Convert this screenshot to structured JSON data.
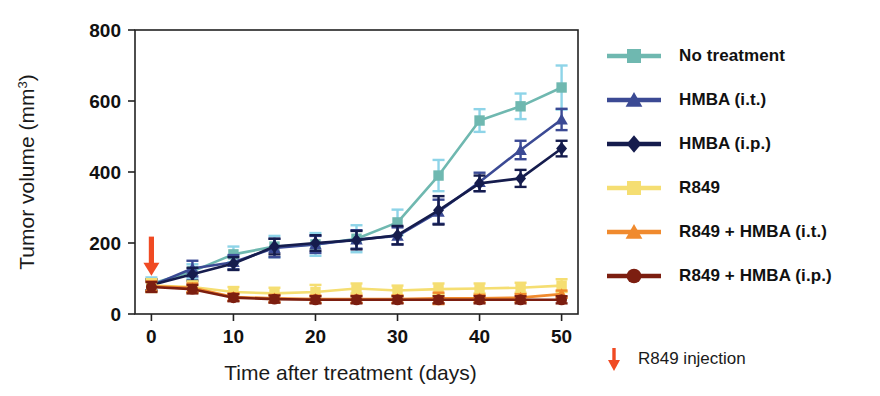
{
  "chart_data": {
    "type": "line",
    "title": "",
    "xlabel": "Time after treatment  (days)",
    "ylabel": "Tumor volume (mm3)",
    "ylabel_base": "Tumor volume (mm",
    "ylabel_sup": "3",
    "ylabel_close": ")",
    "x": [
      0,
      5,
      10,
      15,
      20,
      25,
      30,
      35,
      40,
      45,
      50
    ],
    "xlim": [
      -2,
      52
    ],
    "ylim": [
      0,
      800
    ],
    "xticks": [
      0,
      10,
      20,
      30,
      40,
      50
    ],
    "yticks": [
      0,
      200,
      400,
      600,
      800
    ],
    "xtick_labels": [
      "0",
      "10",
      "20",
      "30",
      "40",
      "50"
    ],
    "ytick_labels": [
      "0",
      "200",
      "400",
      "600",
      "800"
    ],
    "grid": false,
    "legend_position": "right",
    "annotations": [
      {
        "name": "r849-injection-arrow",
        "x": 0,
        "y": 200,
        "label": "R849 injection",
        "color": "#F04A23"
      }
    ],
    "series": [
      {
        "name": "No treatment",
        "color": "#6FB8B0",
        "error_color": "#8ED4E8",
        "marker": "square",
        "values": [
          85,
          120,
          168,
          190,
          196,
          212,
          258,
          390,
          545,
          585,
          638
        ],
        "errors": [
          18,
          20,
          22,
          30,
          32,
          38,
          36,
          44,
          32,
          36,
          62
        ]
      },
      {
        "name": "HMBA (i.t.)",
        "color": "#3B4A94",
        "error_color": "#3B4A94",
        "marker": "triangle",
        "values": [
          80,
          128,
          146,
          186,
          196,
          210,
          220,
          288,
          372,
          462,
          548
        ],
        "errors": [
          16,
          22,
          20,
          26,
          24,
          26,
          24,
          34,
          26,
          26,
          30
        ]
      },
      {
        "name": "HMBA (i.p.)",
        "color": "#151C4D",
        "error_color": "#151C4D",
        "marker": "diamond",
        "values": [
          82,
          112,
          142,
          190,
          200,
          208,
          222,
          292,
          368,
          382,
          466
        ],
        "errors": [
          16,
          18,
          18,
          22,
          22,
          26,
          26,
          40,
          22,
          24,
          22
        ]
      },
      {
        "name": "R849",
        "color": "#F5DE72",
        "error_color": "#F5DE72",
        "marker": "square",
        "values": [
          80,
          76,
          62,
          58,
          62,
          72,
          66,
          70,
          72,
          74,
          80
        ],
        "errors": [
          18,
          16,
          14,
          16,
          20,
          14,
          14,
          16,
          14,
          14,
          18
        ]
      },
      {
        "name": "R849 + HMBA (i.t.)",
        "color": "#F08A2E",
        "error_color": "#F08A2E",
        "marker": "triangle",
        "values": [
          78,
          74,
          48,
          44,
          42,
          42,
          42,
          44,
          44,
          46,
          56
        ],
        "errors": [
          14,
          12,
          10,
          10,
          10,
          10,
          10,
          16,
          10,
          10,
          10
        ]
      },
      {
        "name": "R849 + HMBA (i.p.)",
        "color": "#7C1E10",
        "error_color": "#7C1E10",
        "marker": "circle",
        "values": [
          76,
          70,
          46,
          42,
          40,
          40,
          40,
          40,
          40,
          40,
          40
        ],
        "errors": [
          14,
          12,
          10,
          10,
          10,
          10,
          10,
          10,
          10,
          10,
          10
        ]
      }
    ]
  },
  "legend": {
    "items": [
      {
        "label": "No treatment",
        "color": "#6FB8B0",
        "marker": "square"
      },
      {
        "label": "HMBA (i.t.)",
        "color": "#3B4A94",
        "marker": "triangle"
      },
      {
        "label": "HMBA (i.p.)",
        "color": "#151C4D",
        "marker": "diamond"
      },
      {
        "label": "R849",
        "color": "#F5DE72",
        "marker": "square"
      },
      {
        "label": "R849 + HMBA (i.t.)",
        "color": "#F08A2E",
        "marker": "triangle"
      },
      {
        "label": "R849 + HMBA (i.p.)",
        "color": "#7C1E10",
        "marker": "circle"
      }
    ]
  },
  "footnote": {
    "arrow_color": "#F04A23",
    "text": "R849 injection"
  }
}
